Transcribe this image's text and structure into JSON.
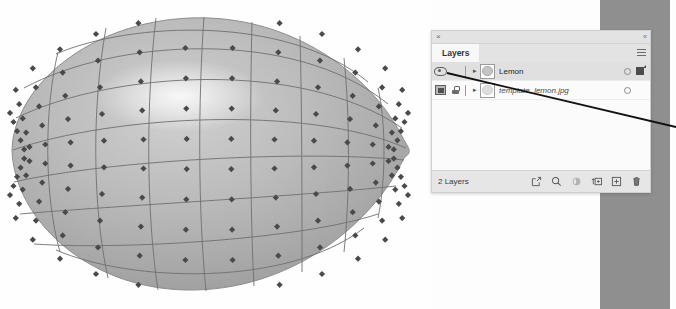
{
  "app": {
    "title": "Layers",
    "panel_close_label": "×",
    "panel_collapse_label": "«",
    "menu_icon": "hamburger-menu-icon"
  },
  "viewport": {
    "name": "lemon-mesh-render",
    "description": "Grayscale 3D lemon model with wireframe cage and vertex handles",
    "mesh": {
      "columns": 13,
      "rows": 9,
      "vertex_shape": "diamond",
      "vertex_color": "#4a4a4a",
      "wire_color": "#6f6f6f",
      "surface_fill": "#b5b5b5",
      "highlight_color": "#e4e4e4"
    }
  },
  "panel": {
    "tab_label": "Layers",
    "layers": [
      {
        "name": "Lemon",
        "selected": true,
        "visible": true,
        "locked": false,
        "italic": false,
        "expand_icon": "chevron-right-icon",
        "thumbnail": "layer-thumbnail",
        "right_indicator": "circle-indicator",
        "has_style_swatch": true
      },
      {
        "name": "template_lemon.jpg",
        "selected": false,
        "visible": true,
        "locked": true,
        "italic": true,
        "expand_icon": "chevron-right-icon",
        "thumbnail": "layer-thumbnail",
        "right_indicator": "circle-indicator",
        "has_style_swatch": false
      }
    ],
    "footer": {
      "count_label": "2 Layers",
      "tools": [
        {
          "name": "extract-layer-icon",
          "enabled": true
        },
        {
          "name": "search-layers-icon",
          "enabled": true
        },
        {
          "name": "adjustment-icon",
          "enabled": false
        },
        {
          "name": "add-mask-icon",
          "enabled": true
        },
        {
          "name": "new-layer-icon",
          "enabled": true
        },
        {
          "name": "delete-layer-icon",
          "enabled": true
        }
      ]
    }
  },
  "annotation": {
    "name": "callout-line",
    "color": "#111111",
    "from_x": 447,
    "from_y": 73,
    "to_x": 676,
    "to_y": 127
  },
  "colors": {
    "rail": "#8f8f8f",
    "panel_bg": "#f8f8f8",
    "panel_header": "#e3e3e3",
    "row_selected": "#e0e0e0",
    "footer_bg": "#e6e6e6",
    "border": "#cfcfcf",
    "canvas": "#fefefe"
  }
}
